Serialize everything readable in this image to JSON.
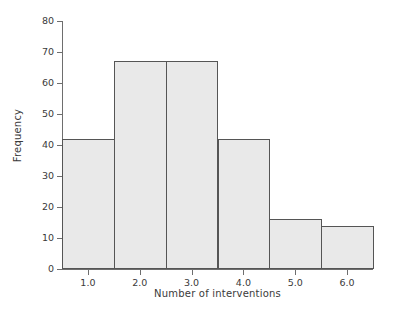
{
  "chart_data": {
    "type": "bar",
    "title": "",
    "subtitle": "",
    "xlabel": "Number of interventions",
    "ylabel": "Frequency",
    "categories": [
      "1.0",
      "2.0",
      "3.0",
      "4.0",
      "5.0",
      "6.0"
    ],
    "values": [
      42,
      67,
      67,
      42,
      16,
      14
    ],
    "bin_edges": [
      0.5,
      1.5,
      2.5,
      3.5,
      4.5,
      5.5,
      6.5
    ],
    "xtick_labels": [
      "1.0",
      "2.0",
      "3.0",
      "4.0",
      "5.0",
      "6.0"
    ],
    "xtick_values": [
      1.0,
      2.0,
      3.0,
      4.0,
      5.0,
      6.0
    ],
    "ytick_labels": [
      "0",
      "10",
      "20",
      "30",
      "40",
      "50",
      "60",
      "70",
      "80"
    ],
    "ytick_values": [
      0,
      10,
      20,
      30,
      40,
      50,
      60,
      70,
      80
    ],
    "xlim": [
      0.5,
      6.5
    ],
    "ylim": [
      0,
      80
    ],
    "grid": false,
    "legend": null,
    "bar_fill_color": "#e9e9e9",
    "bar_edge_color": "#555555",
    "axis_color": "#6e6e6e",
    "text_color": "#3a3a3a",
    "background_color": "#ffffff"
  }
}
